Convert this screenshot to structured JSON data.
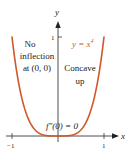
{
  "chart_data": {
    "type": "line",
    "title": "",
    "function": "y = x^4",
    "xlabel": "x",
    "ylabel": "y",
    "xlim": [
      -1,
      1
    ],
    "ylim": [
      0,
      1
    ],
    "x_ticks": [
      "-1",
      "1"
    ],
    "y_ticks": [
      "1"
    ],
    "grid": false,
    "series": [
      {
        "name": "y = x^4",
        "color": "#d2572a",
        "x": [
          -1.0,
          -0.9,
          -0.8,
          -0.7,
          -0.6,
          -0.5,
          -0.4,
          -0.3,
          -0.2,
          -0.1,
          0.0,
          0.1,
          0.2,
          0.3,
          0.4,
          0.5,
          0.6,
          0.7,
          0.8,
          0.9,
          1.0
        ],
        "y": [
          1.0,
          0.6561,
          0.4096,
          0.2401,
          0.1296,
          0.0625,
          0.0256,
          0.0081,
          0.0016,
          0.0001,
          0.0,
          0.0001,
          0.0016,
          0.0081,
          0.0256,
          0.0625,
          0.1296,
          0.2401,
          0.4096,
          0.6561,
          1.0
        ]
      }
    ],
    "annotations": [
      {
        "text": "No inflection at (0, 0)",
        "position": "upper-left"
      },
      {
        "text": "Concave up",
        "position": "upper-right"
      },
      {
        "text": "f''(0) = 0",
        "position": "near origin"
      }
    ]
  },
  "labels": {
    "y_axis": "y",
    "x_axis": "x",
    "y_tick_1": "1",
    "x_tick_neg1": "−1",
    "x_tick_1": "1",
    "curve_label_prefix": "y = x",
    "curve_label_exp": "4",
    "note_left_1": "No",
    "note_left_2": "inflection",
    "note_left_3": "at (0, 0)",
    "note_right_1": "Concave",
    "note_right_2": "up",
    "second_derivative": "f″(0) = 0"
  },
  "colors": {
    "curve": "#d2572a",
    "axis": "#222222",
    "text": "#222222"
  }
}
